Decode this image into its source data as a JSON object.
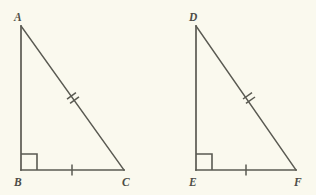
{
  "figure": {
    "background_color": "#faf9ee",
    "stroke_color": "#5a5a52",
    "label_color": "#4d4d46",
    "width": 316,
    "height": 195
  },
  "triangles": [
    {
      "name": "triangle-abc",
      "vertices": [
        {
          "label": "A",
          "x": 21,
          "y": 26,
          "label_x": 14,
          "label_y": 21
        },
        {
          "label": "B",
          "x": 21,
          "y": 170,
          "label_x": 14,
          "label_y": 186
        },
        {
          "label": "C",
          "x": 124,
          "y": 170,
          "label_x": 122,
          "label_y": 186
        }
      ],
      "sides": [
        {
          "name": "leg-ab",
          "from": "A",
          "to": "B",
          "ticks": 0
        },
        {
          "name": "leg-bc",
          "from": "B",
          "to": "C",
          "ticks": 1
        },
        {
          "name": "hypotenuse-ac",
          "from": "A",
          "to": "C",
          "ticks": 2
        }
      ],
      "right_angle_at": "B",
      "right_angle_marker": {
        "x": 21,
        "y": 154,
        "size": 16
      },
      "tick_marks": [
        {
          "name": "single-tick-bc",
          "x": 72,
          "y": 170,
          "angle": 0,
          "count": 1
        },
        {
          "name": "double-tick-ac",
          "x": 73,
          "y": 98,
          "angle": 54.4,
          "count": 2
        }
      ]
    },
    {
      "name": "triangle-def",
      "vertices": [
        {
          "label": "D",
          "x": 196,
          "y": 26,
          "label_x": 189,
          "label_y": 21
        },
        {
          "label": "E",
          "x": 196,
          "y": 170,
          "label_x": 189,
          "label_y": 186
        },
        {
          "label": "F",
          "x": 296,
          "y": 170,
          "label_x": 294,
          "label_y": 186
        }
      ],
      "sides": [
        {
          "name": "leg-de",
          "from": "D",
          "to": "E",
          "ticks": 0
        },
        {
          "name": "leg-ef",
          "from": "E",
          "to": "F",
          "ticks": 1
        },
        {
          "name": "hypotenuse-df",
          "from": "D",
          "to": "F",
          "ticks": 2
        }
      ],
      "right_angle_at": "E",
      "right_angle_marker": {
        "x": 196,
        "y": 154,
        "size": 16
      },
      "tick_marks": [
        {
          "name": "single-tick-ef",
          "x": 246,
          "y": 170,
          "angle": 0,
          "count": 1
        },
        {
          "name": "double-tick-df",
          "x": 249,
          "y": 98,
          "angle": 55.2,
          "count": 2
        }
      ]
    }
  ],
  "labels": {
    "a": "A",
    "b": "B",
    "c": "C",
    "d": "D",
    "e": "E",
    "f": "F"
  }
}
